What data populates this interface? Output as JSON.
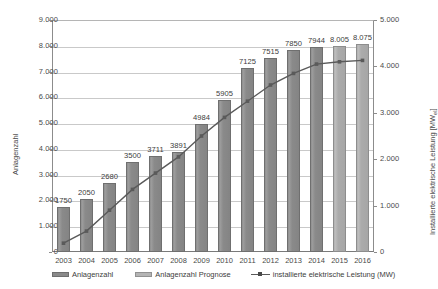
{
  "chart_data": {
    "type": "bar",
    "title": "",
    "subtitle": "",
    "xlabel": "",
    "ylabel": "Anlagenzahl",
    "y2label": "Installierte elektrische Leistung [MW",
    "y2label_sub": "el",
    "y2label_suffix": "]",
    "categories": [
      "2003",
      "2004",
      "2005",
      "2006",
      "2007",
      "2008",
      "2009",
      "2010",
      "2011",
      "2012",
      "2013",
      "2014",
      "2015",
      "2016"
    ],
    "ylim": [
      0,
      9000
    ],
    "y2lim": [
      0,
      5000
    ],
    "yticks": [
      "0",
      "1.000",
      "2.000",
      "3.000",
      "4.000",
      "5.000",
      "6.000",
      "7.000",
      "8.000",
      "9.000"
    ],
    "ytick_values": [
      0,
      1000,
      2000,
      3000,
      4000,
      5000,
      6000,
      7000,
      8000,
      9000
    ],
    "y2ticks": [
      "0",
      "1.000",
      "2.000",
      "3.000",
      "4.000",
      "5.000"
    ],
    "y2tick_values": [
      0,
      1000,
      2000,
      3000,
      4000,
      5000
    ],
    "grid": true,
    "legend_position": "bottom",
    "series": [
      {
        "name": "Anlagenzahl",
        "kind": "bar",
        "axis": "left",
        "color": "#8a8a8a",
        "values": [
          1750,
          2050,
          2680,
          3500,
          3711,
          3891,
          4984,
          5905,
          7125,
          7515,
          7850,
          7944,
          null,
          null
        ],
        "labels": [
          "1750",
          "2050",
          "2680",
          "3500",
          "3711",
          "3891",
          "4984",
          "5905",
          "7125",
          "7515",
          "7850",
          "7944",
          "",
          ""
        ]
      },
      {
        "name": "Anlagenzahl Prognose",
        "kind": "bar",
        "axis": "left",
        "color": "#b4b4b4",
        "values": [
          null,
          null,
          null,
          null,
          null,
          null,
          null,
          null,
          null,
          null,
          null,
          null,
          8005,
          8075
        ],
        "labels": [
          "",
          "",
          "",
          "",
          "",
          "",
          "",
          "",
          "",
          "",
          "",
          "",
          "8.005",
          "8.075"
        ]
      },
      {
        "name": "installierte elektrische Leistung (MW)",
        "kind": "line",
        "axis": "right",
        "color": "#5a5a5a",
        "values": [
          190,
          450,
          900,
          1350,
          1700,
          2050,
          2500,
          2900,
          3250,
          3600,
          3850,
          4050,
          4100,
          4130
        ]
      }
    ]
  },
  "legend": {
    "items": [
      {
        "label": "Anlagenzahl",
        "marker": "bar-swatch"
      },
      {
        "label": "Anlagenzahl Prognose",
        "marker": "bar-swatch-forecast"
      },
      {
        "label": "installierte elektrische Leistung (MW)",
        "marker": "line-swatch"
      }
    ]
  },
  "colors": {
    "bar": "#8a8a8a",
    "bar_forecast": "#b4b4b4",
    "line": "#5a5a5a",
    "grid": "#c9c9c9",
    "axis": "#8c8c8c",
    "text": "#3d3d3d",
    "background": "#ffffff"
  }
}
